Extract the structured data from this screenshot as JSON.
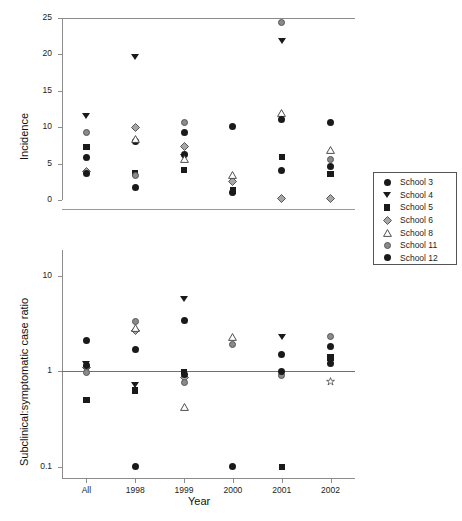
{
  "figure": {
    "width": 462,
    "height": 521,
    "background": "#ffffff"
  },
  "axis_titles": {
    "x": "Year",
    "y_top": "Incidence",
    "y_bottom": "Subclinical:symptomatic case ratio"
  },
  "legend": {
    "entries": [
      {
        "label": "School 3",
        "marker": "circle",
        "color": "#1a1a1a"
      },
      {
        "label": "School 4",
        "marker": "triangle-down",
        "color": "#1a1a1a"
      },
      {
        "label": "School 5",
        "marker": "square",
        "color": "#1a1a1a"
      },
      {
        "label": "School 6",
        "marker": "diamond",
        "color": "#9a9a9a"
      },
      {
        "label": "School 8",
        "marker": "triangle-up",
        "color": "#ffffff"
      },
      {
        "label": "School 11",
        "marker": "circle-gray",
        "color": "#8a8a8a"
      },
      {
        "label": "School 12",
        "marker": "circle",
        "color": "#1a1a1a"
      }
    ]
  },
  "chart_data": [
    {
      "type": "scatter",
      "panel": "top",
      "title": "",
      "xlabel": "Year",
      "ylabel": "Incidence",
      "categories": [
        "All",
        "1998",
        "1999",
        "2000",
        "2001",
        "2002"
      ],
      "ylim": [
        0,
        25
      ],
      "yticks": [
        0,
        5,
        10,
        15,
        20,
        25
      ],
      "yticklabels": [
        "0",
        "5",
        "10",
        "15",
        "20",
        "25"
      ],
      "yscale": "linear",
      "grid": false,
      "legend_position": "right",
      "series": [
        {
          "name": "School 3",
          "marker": "circle",
          "points": [
            {
              "x": "All",
              "y": 5.9
            },
            {
              "x": "1998",
              "y": 8.0
            },
            {
              "x": "1999",
              "y": 6.2
            },
            {
              "x": "2000",
              "y": 10.1
            },
            {
              "x": "2001",
              "y": 4.0
            },
            {
              "x": "2002",
              "y": 4.6
            }
          ]
        },
        {
          "name": "School 4",
          "marker": "triangle-down",
          "points": [
            {
              "x": "All",
              "y": 11.5
            },
            {
              "x": "1998",
              "y": 19.6
            },
            {
              "x": "1999",
              "y": 5.9
            },
            {
              "x": "2001",
              "y": 21.8
            }
          ]
        },
        {
          "name": "School 5",
          "marker": "square",
          "points": [
            {
              "x": "All",
              "y": 7.3
            },
            {
              "x": "1998",
              "y": 3.7
            },
            {
              "x": "1999",
              "y": 4.1
            },
            {
              "x": "2000",
              "y": 1.3
            },
            {
              "x": "2001",
              "y": 5.9
            },
            {
              "x": "2002",
              "y": 3.6
            }
          ]
        },
        {
          "name": "School 6",
          "marker": "diamond",
          "points": [
            {
              "x": "All",
              "y": 3.9
            },
            {
              "x": "1998",
              "y": 10.0
            },
            {
              "x": "1999",
              "y": 7.4
            },
            {
              "x": "2000",
              "y": 2.5
            },
            {
              "x": "2001",
              "y": 0.2
            },
            {
              "x": "2002",
              "y": 0.2
            }
          ]
        },
        {
          "name": "School 8",
          "marker": "triangle-up",
          "points": [
            {
              "x": "1998",
              "y": 8.4
            },
            {
              "x": "1999",
              "y": 5.6
            },
            {
              "x": "2000",
              "y": 3.5
            },
            {
              "x": "2001",
              "y": 11.9
            },
            {
              "x": "2002",
              "y": 6.9
            }
          ]
        },
        {
          "name": "School 11",
          "marker": "circle-gray",
          "points": [
            {
              "x": "All",
              "y": 9.3
            },
            {
              "x": "1998",
              "y": 3.4
            },
            {
              "x": "1999",
              "y": 10.7
            },
            {
              "x": "2001",
              "y": 24.4
            },
            {
              "x": "2002",
              "y": 5.6
            }
          ]
        },
        {
          "name": "School 12",
          "marker": "circle",
          "points": [
            {
              "x": "All",
              "y": 3.6
            },
            {
              "x": "1998",
              "y": 1.7
            },
            {
              "x": "1999",
              "y": 9.3
            },
            {
              "x": "2000",
              "y": 1.0
            },
            {
              "x": "2001",
              "y": 11.1
            },
            {
              "x": "2002",
              "y": 10.6
            }
          ]
        }
      ]
    },
    {
      "type": "scatter",
      "panel": "bottom",
      "title": "",
      "xlabel": "Year",
      "ylabel": "Subclinical:symptomatic case ratio",
      "categories": [
        "All",
        "1998",
        "1999",
        "2000",
        "2001",
        "2002"
      ],
      "ylim": [
        0.08,
        14
      ],
      "yticks": [
        0.1,
        1,
        10
      ],
      "yticklabels": [
        "0.1",
        "1",
        "10"
      ],
      "yscale": "log",
      "reference_line_y": 1,
      "grid": false,
      "legend_position": "right",
      "series": [
        {
          "name": "School 3",
          "marker": "circle",
          "points": [
            {
              "x": "All",
              "y": 2.1
            },
            {
              "x": "1998",
              "y": 1.7
            },
            {
              "x": "1999",
              "y": 3.4
            },
            {
              "x": "2000",
              "y": 0.1
            },
            {
              "x": "2001",
              "y": 1.5
            },
            {
              "x": "2002",
              "y": 1.8
            }
          ]
        },
        {
          "name": "School 4",
          "marker": "triangle-down",
          "points": [
            {
              "x": "All",
              "y": 1.2
            },
            {
              "x": "1998",
              "y": 0.72
            },
            {
              "x": "1999",
              "y": 5.7
            },
            {
              "x": "2001",
              "y": 2.3
            }
          ]
        },
        {
          "name": "School 5",
          "marker": "square",
          "points": [
            {
              "x": "All",
              "y": 0.5
            },
            {
              "x": "1998",
              "y": 0.63
            },
            {
              "x": "1999",
              "y": 0.98
            },
            {
              "x": "2001",
              "y": 0.1
            },
            {
              "x": "2002",
              "y": 1.4
            }
          ]
        },
        {
          "name": "School 6",
          "marker": "diamond",
          "points": [
            {
              "x": "All",
              "y": 1.1
            },
            {
              "x": "1998",
              "y": 2.7
            },
            {
              "x": "1999",
              "y": 0.86
            },
            {
              "x": "2002",
              "y": 0.78
            }
          ]
        },
        {
          "name": "School 8",
          "marker": "triangle-up",
          "points": [
            {
              "x": "1998",
              "y": 2.85
            },
            {
              "x": "1999",
              "y": 0.42
            },
            {
              "x": "2000",
              "y": 2.3
            }
          ]
        },
        {
          "name": "School 11",
          "marker": "circle-gray",
          "points": [
            {
              "x": "All",
              "y": 0.98
            },
            {
              "x": "1998",
              "y": 3.3
            },
            {
              "x": "1999",
              "y": 0.76
            },
            {
              "x": "2000",
              "y": 1.9
            },
            {
              "x": "2001",
              "y": 0.9
            },
            {
              "x": "2002",
              "y": 2.3
            }
          ]
        },
        {
          "name": "School 12",
          "marker": "circle",
          "points": [
            {
              "x": "All",
              "y": 1.15
            },
            {
              "x": "1998",
              "y": 0.1
            },
            {
              "x": "1999",
              "y": 0.93
            },
            {
              "x": "2001",
              "y": 1.0
            },
            {
              "x": "2002",
              "y": 1.2
            }
          ]
        }
      ]
    }
  ]
}
